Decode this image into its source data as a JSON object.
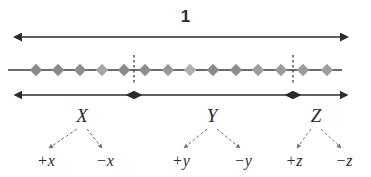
{
  "figure": {
    "type": "number-line-partition-diagram",
    "total_label": "1",
    "axis": {
      "x_start": 22,
      "x_end": 340,
      "y": 70
    },
    "top_measure": {
      "label": "1",
      "x_start": 22,
      "x_end": 340,
      "y": 37,
      "arrow": "double"
    },
    "dividers": [
      {
        "name": "divider-x-y",
        "x": 134
      },
      {
        "name": "divider-y-z",
        "x": 293
      }
    ],
    "markers": [
      {
        "x": 36,
        "shade": "#8a8a8a"
      },
      {
        "x": 58,
        "shade": "#8a8a8a"
      },
      {
        "x": 80,
        "shade": "#8d8d8d"
      },
      {
        "x": 102,
        "shade": "#a8a8a8"
      },
      {
        "x": 124,
        "shade": "#8a8a8a"
      },
      {
        "x": 145,
        "shade": "#8d8d8d"
      },
      {
        "x": 168,
        "shade": "#9a9a9a"
      },
      {
        "x": 190,
        "shade": "#b0b0b0"
      },
      {
        "x": 213,
        "shade": "#8a8a8a"
      },
      {
        "x": 236,
        "shade": "#8d8d8d"
      },
      {
        "x": 258,
        "shade": "#9e9e9e"
      },
      {
        "x": 281,
        "shade": "#9a9a9a"
      },
      {
        "x": 303,
        "shade": "#9a9a9a"
      },
      {
        "x": 327,
        "shade": "#9e9e9e"
      }
    ],
    "segments": [
      {
        "name": "segment-x",
        "group_label": "X",
        "x_start": 22,
        "x_end": 134,
        "center": 82,
        "arrow_y": 95,
        "label_y": 105,
        "leaves": [
          {
            "label": "+x",
            "x": 46
          },
          {
            "label": "−x",
            "x": 105
          }
        ]
      },
      {
        "name": "segment-y",
        "group_label": "Y",
        "x_start": 134,
        "x_end": 293,
        "center": 212,
        "arrow_y": 95,
        "label_y": 105,
        "leaves": [
          {
            "label": "+y",
            "x": 181
          },
          {
            "label": "−y",
            "x": 243
          }
        ]
      },
      {
        "name": "segment-z",
        "group_label": "Z",
        "x_start": 293,
        "x_end": 340,
        "center": 316,
        "arrow_y": 95,
        "label_y": 105,
        "leaves": [
          {
            "label": "+z",
            "x": 294
          },
          {
            "label": "−z",
            "x": 344
          }
        ]
      }
    ],
    "leaf_label_y": 152,
    "colors": {
      "line": "#3a3a3a",
      "arrow": "#2b2b2b",
      "marker_default": "#8f8f8f",
      "text": "#2d2d2d",
      "background": "#ffffff",
      "divider": "#4a4a4a",
      "connector": "#6f6f6f"
    }
  }
}
